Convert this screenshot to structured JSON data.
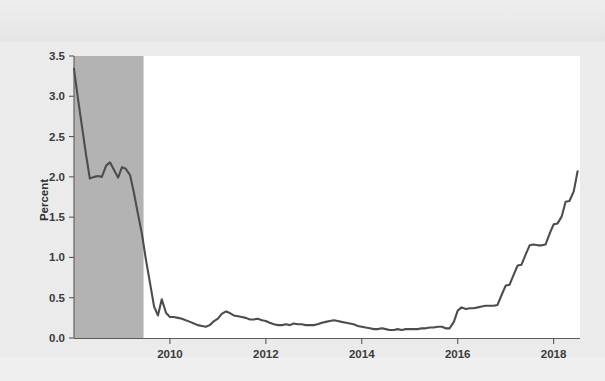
{
  "chart_data": {
    "type": "line",
    "title": "",
    "subtitle": "",
    "xlabel": "",
    "ylabel": "Percent",
    "xlim": [
      2008.0,
      2018.55
    ],
    "ylim": [
      0.0,
      3.5
    ],
    "grid": false,
    "legend": null,
    "x_ticks": [
      "2010",
      "2012",
      "2014",
      "2016",
      "2018"
    ],
    "x_tick_values": [
      2010,
      2012,
      2014,
      2016,
      2018
    ],
    "y_ticks": [
      "0.0",
      "0.5",
      "1.0",
      "1.5",
      "2.0",
      "2.5",
      "3.0",
      "3.5"
    ],
    "y_tick_values": [
      0.0,
      0.5,
      1.0,
      1.5,
      2.0,
      2.5,
      3.0,
      3.5
    ],
    "line_color": "#4d4d4d",
    "plot_background": "#ffffff",
    "page_background": "#ebebeb",
    "shaded_regions": [
      {
        "name": "recession",
        "x_start": 2008.0,
        "x_end": 2009.45,
        "color": "#b3b3b3"
      }
    ],
    "series": [
      {
        "name": "Effective federal funds rate",
        "x": [
          2008.0,
          2008.08,
          2008.17,
          2008.25,
          2008.33,
          2008.42,
          2008.5,
          2008.58,
          2008.67,
          2008.75,
          2008.83,
          2008.92,
          2009.0,
          2009.08,
          2009.17,
          2009.25,
          2009.33,
          2009.42,
          2009.5,
          2009.58,
          2009.67,
          2009.75,
          2009.83,
          2009.92,
          2010.0,
          2010.08,
          2010.17,
          2010.25,
          2010.33,
          2010.42,
          2010.5,
          2010.58,
          2010.67,
          2010.75,
          2010.83,
          2010.92,
          2011.0,
          2011.08,
          2011.17,
          2011.25,
          2011.33,
          2011.42,
          2011.5,
          2011.58,
          2011.67,
          2011.75,
          2011.83,
          2011.92,
          2012.0,
          2012.08,
          2012.17,
          2012.25,
          2012.33,
          2012.42,
          2012.5,
          2012.58,
          2012.67,
          2012.75,
          2012.83,
          2012.92,
          2013.0,
          2013.08,
          2013.17,
          2013.25,
          2013.33,
          2013.42,
          2013.5,
          2013.58,
          2013.67,
          2013.75,
          2013.83,
          2013.92,
          2014.0,
          2014.08,
          2014.17,
          2014.25,
          2014.33,
          2014.42,
          2014.5,
          2014.58,
          2014.67,
          2014.75,
          2014.83,
          2014.92,
          2015.0,
          2015.08,
          2015.17,
          2015.25,
          2015.33,
          2015.42,
          2015.5,
          2015.58,
          2015.67,
          2015.75,
          2015.83,
          2015.92,
          2016.0,
          2016.08,
          2016.17,
          2016.25,
          2016.33,
          2016.42,
          2016.5,
          2016.58,
          2016.67,
          2016.75,
          2016.83,
          2016.92,
          2017.0,
          2017.08,
          2017.17,
          2017.25,
          2017.33,
          2017.42,
          2017.5,
          2017.58,
          2017.67,
          2017.75,
          2017.83,
          2017.92,
          2018.0,
          2018.08,
          2018.17,
          2018.25,
          2018.33,
          2018.42,
          2018.5
        ],
        "y": [
          3.34,
          2.98,
          2.61,
          2.28,
          1.98,
          2.0,
          2.01,
          2.0,
          2.14,
          2.18,
          2.09,
          1.99,
          2.12,
          2.1,
          2.02,
          1.8,
          1.55,
          1.28,
          0.97,
          0.7,
          0.39,
          0.28,
          0.48,
          0.31,
          0.26,
          0.26,
          0.25,
          0.24,
          0.22,
          0.2,
          0.18,
          0.16,
          0.15,
          0.14,
          0.16,
          0.21,
          0.24,
          0.3,
          0.33,
          0.31,
          0.28,
          0.27,
          0.26,
          0.25,
          0.23,
          0.23,
          0.24,
          0.22,
          0.21,
          0.19,
          0.17,
          0.16,
          0.16,
          0.17,
          0.16,
          0.18,
          0.17,
          0.17,
          0.16,
          0.16,
          0.16,
          0.17,
          0.19,
          0.2,
          0.21,
          0.22,
          0.21,
          0.2,
          0.19,
          0.18,
          0.17,
          0.15,
          0.14,
          0.13,
          0.12,
          0.11,
          0.11,
          0.12,
          0.11,
          0.1,
          0.1,
          0.11,
          0.1,
          0.11,
          0.11,
          0.11,
          0.11,
          0.12,
          0.12,
          0.13,
          0.13,
          0.14,
          0.14,
          0.12,
          0.12,
          0.2,
          0.34,
          0.38,
          0.36,
          0.37,
          0.37,
          0.38,
          0.39,
          0.4,
          0.4,
          0.4,
          0.41,
          0.54,
          0.65,
          0.66,
          0.79,
          0.9,
          0.91,
          1.04,
          1.15,
          1.16,
          1.15,
          1.15,
          1.16,
          1.3,
          1.41,
          1.42,
          1.51,
          1.69,
          1.7,
          1.82,
          2.07
        ]
      }
    ]
  },
  "axes": {
    "y_axis_title": "Percent"
  }
}
